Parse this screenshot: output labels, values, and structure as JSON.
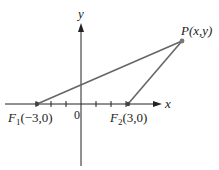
{
  "diagram": {
    "type": "coordinate-plane-foci",
    "axes": {
      "x_label": "x",
      "y_label": "y",
      "origin_label": "0"
    },
    "points": [
      {
        "id": "F1",
        "name": "F",
        "subscript": "1",
        "coords": "(−3,0)",
        "x": -3,
        "y": 0
      },
      {
        "id": "F2",
        "name": "F",
        "subscript": "2",
        "coords": "(3,0)",
        "x": 3,
        "y": 0
      },
      {
        "id": "P",
        "name": "P",
        "coords": "(x,y)"
      }
    ],
    "segments": [
      {
        "from": "F1",
        "to": "P"
      },
      {
        "from": "F2",
        "to": "P"
      }
    ],
    "colors": {
      "axis": "#222222",
      "segment": "#666666",
      "point": "#444444"
    }
  }
}
